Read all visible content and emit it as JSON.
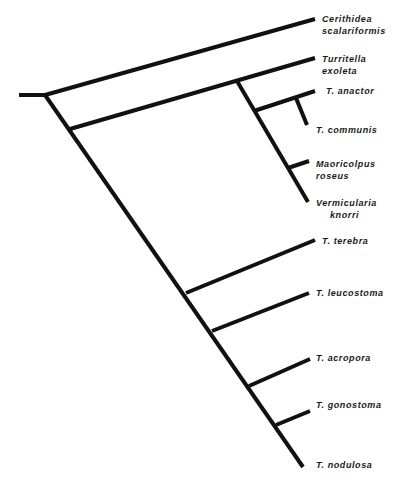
{
  "diagram": {
    "type": "cladogram",
    "line_color": "#111111",
    "taxa": [
      {
        "id": "cerithidea",
        "line1": "Cerithidea",
        "line2": "scalariformis"
      },
      {
        "id": "turritella",
        "line1": "Turritella",
        "line2": "exoleta"
      },
      {
        "id": "anactor",
        "line1": "T.  anactor"
      },
      {
        "id": "communis",
        "line1": "T.  communis"
      },
      {
        "id": "maoricolpus",
        "line1": "Maoricolpus",
        "line2": "roseus"
      },
      {
        "id": "vermicularia",
        "line1": "Vermicularia",
        "line2": "knorri"
      },
      {
        "id": "terebra",
        "line1": "T.  terebra"
      },
      {
        "id": "leucostoma",
        "line1": "T.  leucostoma"
      },
      {
        "id": "acropora",
        "line1": "T.  acropora"
      },
      {
        "id": "gonostoma",
        "line1": "T.  gonostoma"
      },
      {
        "id": "nodulosa",
        "line1": "T.  nodulosa"
      }
    ]
  }
}
